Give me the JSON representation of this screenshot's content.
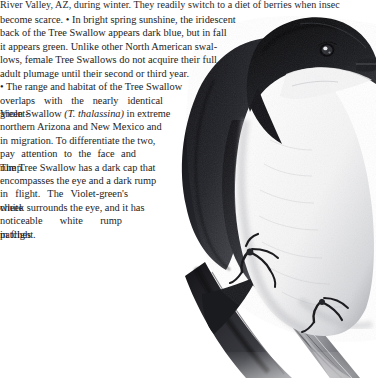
{
  "page": {
    "type": "field-guide-page",
    "species_common_name": "Tree Swallow",
    "background_color": "#ffffff",
    "text_color": "#1d1d1d",
    "width": 376,
    "height": 378
  },
  "body_text": {
    "top_clipped_line": "River Valley, AZ, during winter. They readily switch to a diet of berries when insec",
    "lines": [
      {
        "text": "become scarce. • In bright spring sunshine, the iridescent",
        "width": 232,
        "justify": false
      },
      {
        "text": "back of the Tree Swallow appears dark blue, but in fall",
        "width": 218,
        "justify": false
      },
      {
        "text": "it appears green. Unlike other North American swal-",
        "width": 210,
        "justify": false
      },
      {
        "text": "lows, female Tree Swallows do not acquire their full",
        "width": 202,
        "justify": false
      },
      {
        "text": "adult plumage until their second or third year.",
        "width": 186,
        "justify": false
      },
      {
        "text": "• The range and habitat of the Tree Swallow",
        "width": 175,
        "justify": false
      },
      {
        "text": "overlaps with the nearly identical Violet-",
        "width": 163,
        "justify": true
      },
      {
        "text": "green Swallow (T. thalassina) in extreme",
        "width": 155,
        "justify": false,
        "italic_segment": "(T. thalassina)"
      },
      {
        "text": "northern Arizona and New Mexico and",
        "width": 148,
        "justify": false
      },
      {
        "text": "in migration. To differentiate the two,",
        "width": 143,
        "justify": false
      },
      {
        "text": "pay attention to the face and rump.",
        "width": 136,
        "justify": true
      },
      {
        "text": "The Tree Swallow has a dark cap that",
        "width": 136,
        "justify": false
      },
      {
        "text": "encompasses the eye and a dark rump",
        "width": 135,
        "justify": false
      },
      {
        "text": "in flight. The Violet-green's white",
        "width": 128,
        "justify": true
      },
      {
        "text": "cheek surrounds the eye, and it has",
        "width": 128,
        "justify": false
      },
      {
        "text": "noticeable white rump patches",
        "width": 122,
        "justify": true
      },
      {
        "text": "in flight.",
        "width": 40,
        "justify": false
      }
    ]
  },
  "illustration": {
    "name": "tree-swallow-illustration",
    "description": "Graphite drawing of a Tree Swallow perched on a diagonal branch, dark glossy cap and back, white underparts, viewed from the side-front.",
    "parts": [
      "dark-cap",
      "eye",
      "beak",
      "white-throat",
      "white-breast",
      "dark-back",
      "folded-wing",
      "tail",
      "foot",
      "branch"
    ],
    "ink_dark": "#16161a",
    "ink_mid": "#595a5f",
    "ink_light": "#b8b9bd"
  }
}
